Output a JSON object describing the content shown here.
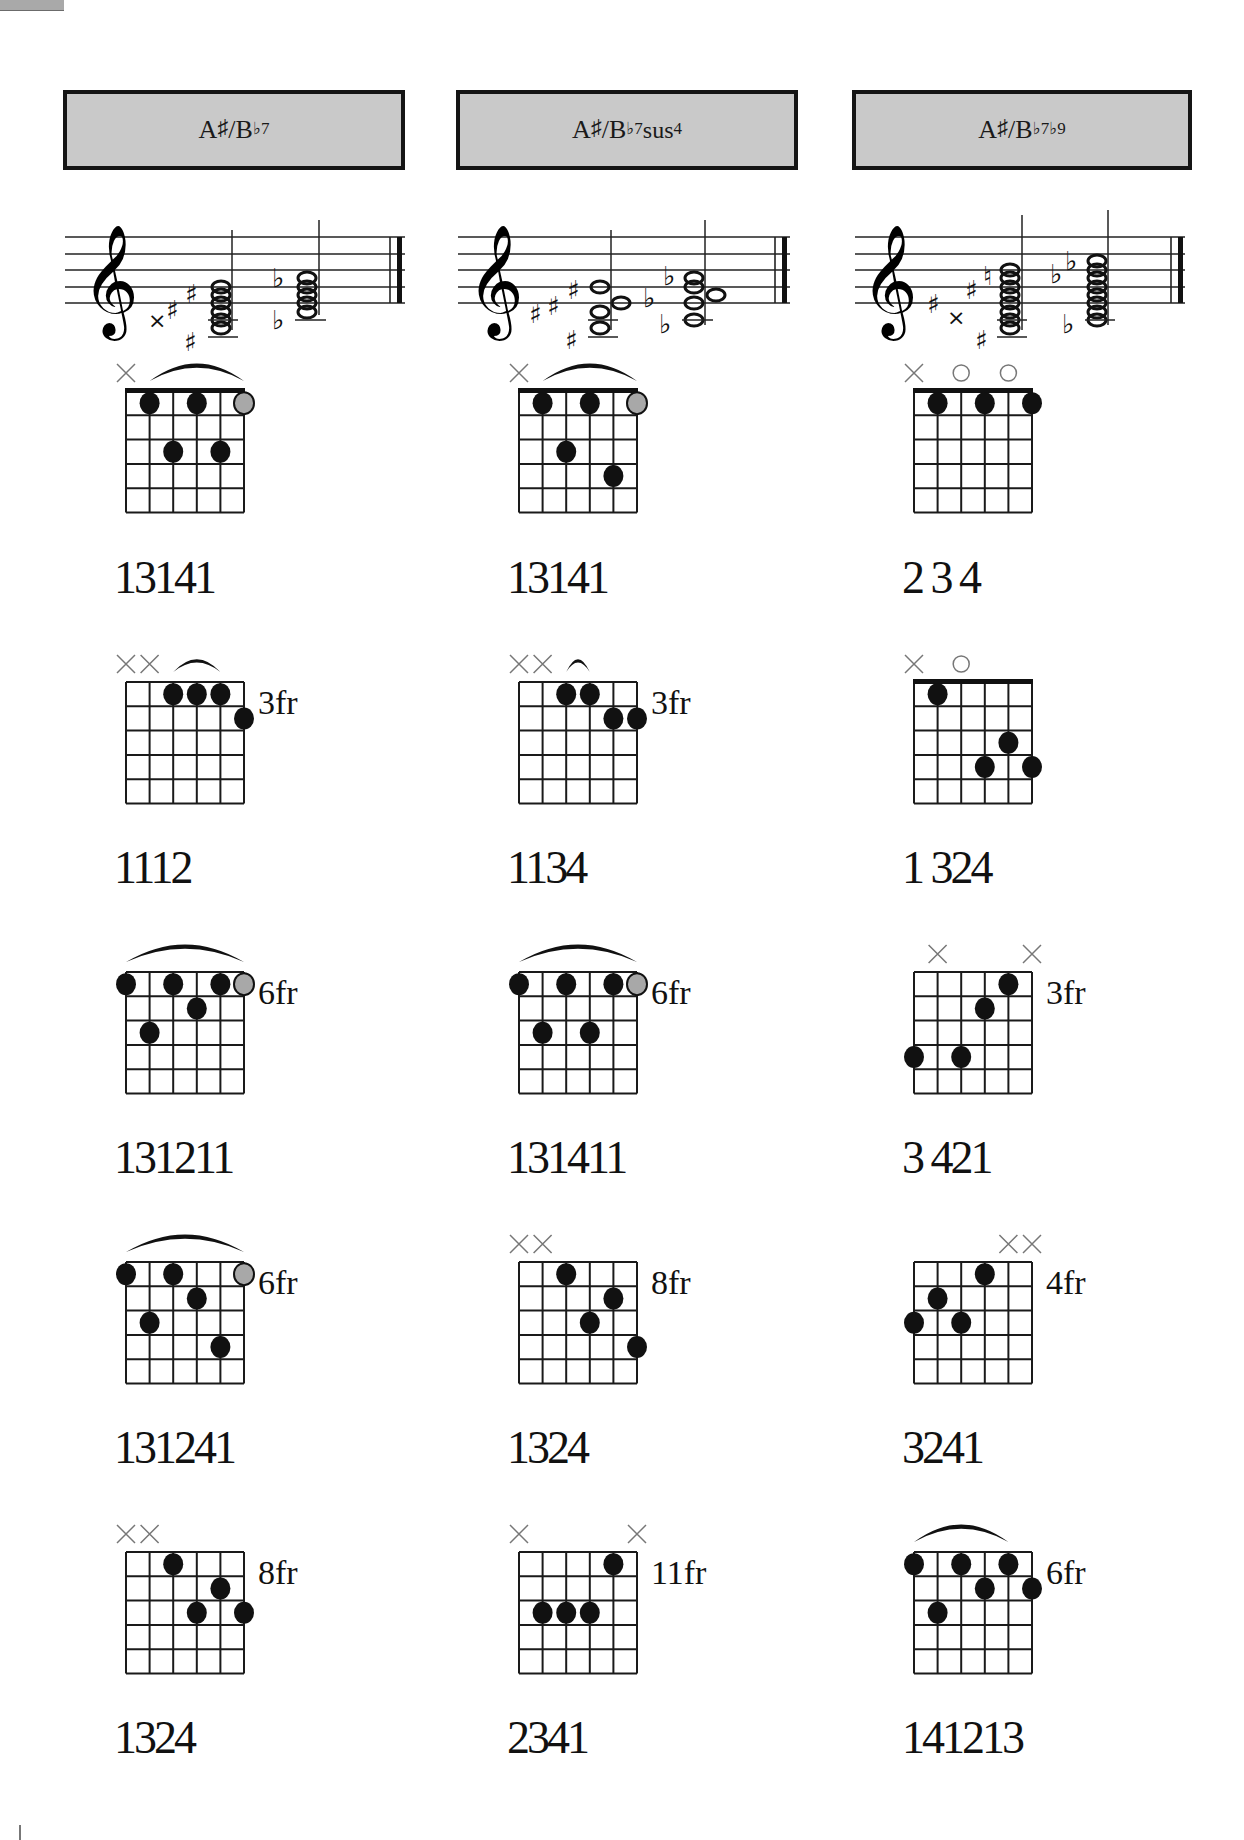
{
  "page": {
    "columns": [
      {
        "title": {
          "root": "A",
          "root_acc": "♯",
          "slash": "/B",
          "alt_acc": "♭",
          "ext": "7",
          "ext2": ""
        },
        "title_text": "A♯/B♭7",
        "staff": {
          "chord1_accidentals": "× ♯ ♯ ♯",
          "chord2_accidentals": "♭ ♭"
        },
        "chords": [
          {
            "fingering": "13141",
            "fret_label": "",
            "muted": [
              1
            ],
            "open": [],
            "barre": {
              "from": 2,
              "to": 6,
              "fret": 1
            },
            "dots": [
              {
                "s": 2,
                "f": 1
              },
              {
                "s": 4,
                "f": 1
              },
              {
                "s": 6,
                "f": 1,
                "gray": true
              },
              {
                "s": 3,
                "f": 3
              },
              {
                "s": 5,
                "f": 3
              }
            ],
            "nut": true
          },
          {
            "fingering": "1112",
            "fret_label": "3fr",
            "muted": [
              1,
              2
            ],
            "open": [],
            "barre": {
              "from": 3,
              "to": 5,
              "fret": 1,
              "small": true
            },
            "dots": [
              {
                "s": 3,
                "f": 1
              },
              {
                "s": 4,
                "f": 1
              },
              {
                "s": 5,
                "f": 1
              },
              {
                "s": 6,
                "f": 2
              }
            ],
            "nut": false
          },
          {
            "fingering": "131211",
            "fret_label": "6fr",
            "muted": [],
            "open": [],
            "barre": {
              "from": 1,
              "to": 6,
              "fret": 1
            },
            "dots": [
              {
                "s": 1,
                "f": 1
              },
              {
                "s": 3,
                "f": 1
              },
              {
                "s": 5,
                "f": 1
              },
              {
                "s": 6,
                "f": 1,
                "gray": true
              },
              {
                "s": 4,
                "f": 2
              },
              {
                "s": 2,
                "f": 3
              }
            ],
            "nut": false
          },
          {
            "fingering": "131241",
            "fret_label": "6fr",
            "muted": [],
            "open": [],
            "barre": {
              "from": 1,
              "to": 6,
              "fret": 1
            },
            "dots": [
              {
                "s": 1,
                "f": 1
              },
              {
                "s": 3,
                "f": 1
              },
              {
                "s": 6,
                "f": 1,
                "gray": true
              },
              {
                "s": 4,
                "f": 2
              },
              {
                "s": 2,
                "f": 3
              },
              {
                "s": 5,
                "f": 4
              }
            ],
            "nut": false
          },
          {
            "fingering": "1324",
            "fret_label": "8fr",
            "muted": [
              1,
              2
            ],
            "open": [],
            "barre": null,
            "dots": [
              {
                "s": 3,
                "f": 1
              },
              {
                "s": 5,
                "f": 2
              },
              {
                "s": 4,
                "f": 3
              },
              {
                "s": 6,
                "f": 3
              }
            ],
            "nut": false
          }
        ]
      },
      {
        "title": {
          "root": "A",
          "root_acc": "♯",
          "slash": "/B",
          "alt_acc": "♭",
          "ext": "7",
          "ext2": "sus4"
        },
        "title_text": "A♯/B♭7sus4",
        "staff": {
          "chord1_accidentals": "♯ ♯ ♯ ♯",
          "chord2_accidentals": "♭ ♭ ♭"
        },
        "chords": [
          {
            "fingering": "13141",
            "fret_label": "",
            "muted": [
              1
            ],
            "open": [],
            "barre": {
              "from": 2,
              "to": 6,
              "fret": 1
            },
            "dots": [
              {
                "s": 2,
                "f": 1
              },
              {
                "s": 4,
                "f": 1
              },
              {
                "s": 6,
                "f": 1,
                "gray": true
              },
              {
                "s": 3,
                "f": 3
              },
              {
                "s": 5,
                "f": 4
              }
            ],
            "nut": true
          },
          {
            "fingering": "1134",
            "fret_label": "3fr",
            "muted": [
              1,
              2
            ],
            "open": [],
            "barre": {
              "from": 3,
              "to": 4,
              "fret": 1,
              "small": true
            },
            "dots": [
              {
                "s": 3,
                "f": 1
              },
              {
                "s": 4,
                "f": 1
              },
              {
                "s": 5,
                "f": 2
              },
              {
                "s": 6,
                "f": 2
              }
            ],
            "nut": false
          },
          {
            "fingering": "131411",
            "fret_label": "6fr",
            "muted": [],
            "open": [],
            "barre": {
              "from": 1,
              "to": 6,
              "fret": 1
            },
            "dots": [
              {
                "s": 1,
                "f": 1
              },
              {
                "s": 3,
                "f": 1
              },
              {
                "s": 5,
                "f": 1
              },
              {
                "s": 6,
                "f": 1,
                "gray": true
              },
              {
                "s": 2,
                "f": 3
              },
              {
                "s": 4,
                "f": 3
              }
            ],
            "nut": false
          },
          {
            "fingering": "1324",
            "fret_label": "8fr",
            "muted": [
              1,
              2
            ],
            "open": [],
            "barre": null,
            "dots": [
              {
                "s": 3,
                "f": 1
              },
              {
                "s": 5,
                "f": 2
              },
              {
                "s": 4,
                "f": 3
              },
              {
                "s": 6,
                "f": 4
              }
            ],
            "nut": false
          },
          {
            "fingering": "2341",
            "fret_label": "11fr",
            "muted": [
              1,
              6
            ],
            "open": [],
            "barre": null,
            "dots": [
              {
                "s": 5,
                "f": 1
              },
              {
                "s": 2,
                "f": 3
              },
              {
                "s": 3,
                "f": 3
              },
              {
                "s": 4,
                "f": 3
              }
            ],
            "nut": false
          }
        ]
      },
      {
        "title": {
          "root": "A",
          "root_acc": "♯",
          "slash": "/B",
          "alt_acc": "♭",
          "ext": "7",
          "ext2": "♭9"
        },
        "title_text": "A♯/B♭7♭9",
        "staff": {
          "chord1_accidentals": "♯ × ♯ ♮ ♯",
          "chord2_accidentals": "♭ ♭ ♭"
        },
        "chords": [
          {
            "fingering": "2 3 4",
            "fret_label": "",
            "muted": [
              1
            ],
            "open": [
              3,
              5
            ],
            "barre": null,
            "dots": [
              {
                "s": 2,
                "f": 1
              },
              {
                "s": 4,
                "f": 1
              },
              {
                "s": 6,
                "f": 1
              }
            ],
            "nut": true
          },
          {
            "fingering": "1 324",
            "fret_label": "",
            "muted": [
              1
            ],
            "open": [
              3
            ],
            "barre": null,
            "dots": [
              {
                "s": 2,
                "f": 1
              },
              {
                "s": 5,
                "f": 3
              },
              {
                "s": 4,
                "f": 4
              },
              {
                "s": 6,
                "f": 4
              }
            ],
            "nut": true
          },
          {
            "fingering": "3 421",
            "fret_label": "3fr",
            "muted": [
              2,
              6
            ],
            "open": [],
            "barre": null,
            "dots": [
              {
                "s": 5,
                "f": 1
              },
              {
                "s": 4,
                "f": 2
              },
              {
                "s": 1,
                "f": 4
              },
              {
                "s": 3,
                "f": 4
              }
            ],
            "nut": false
          },
          {
            "fingering": "3241",
            "fret_label": "4fr",
            "muted": [
              5,
              6
            ],
            "open": [],
            "barre": null,
            "dots": [
              {
                "s": 4,
                "f": 1
              },
              {
                "s": 2,
                "f": 2
              },
              {
                "s": 1,
                "f": 3
              },
              {
                "s": 3,
                "f": 3
              }
            ],
            "nut": false
          },
          {
            "fingering": "141213",
            "fret_label": "6fr",
            "muted": [],
            "open": [],
            "barre": {
              "from": 1,
              "to": 5,
              "fret": 1
            },
            "dots": [
              {
                "s": 1,
                "f": 1
              },
              {
                "s": 3,
                "f": 1
              },
              {
                "s": 5,
                "f": 1
              },
              {
                "s": 4,
                "f": 2
              },
              {
                "s": 6,
                "f": 2
              },
              {
                "s": 2,
                "f": 3
              }
            ],
            "nut": false
          }
        ]
      }
    ]
  }
}
